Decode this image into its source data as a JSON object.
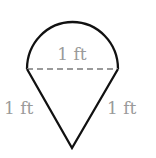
{
  "diagram": {
    "shapes": {
      "semicircle": {
        "diameter": "1 ft"
      },
      "triangle": {
        "left_side": "1 ft",
        "right_side": "1 ft"
      }
    },
    "labels": {
      "diameter": "1 ft",
      "left_side": "1 ft",
      "right_side": "1 ft"
    },
    "colors": {
      "outline": "#111111",
      "dashed_line": "#9a9a9a",
      "label_text": "#9a9a9a"
    }
  }
}
